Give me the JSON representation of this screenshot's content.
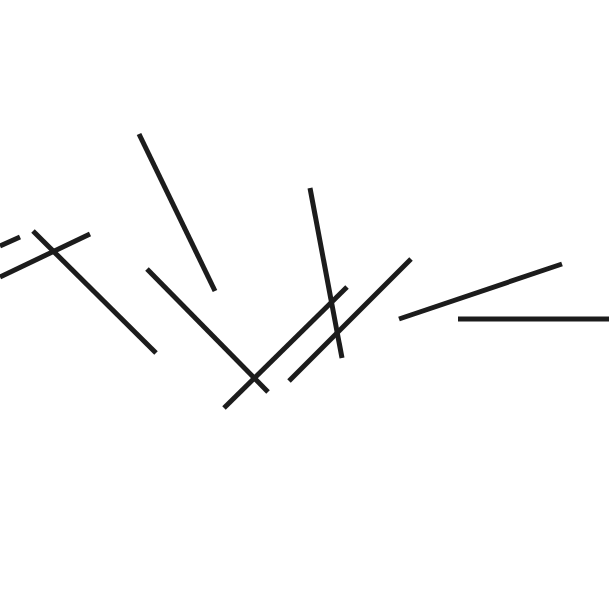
{
  "canvas": {
    "width": 609,
    "height": 600,
    "background": "#ffffff"
  },
  "stroke": {
    "color": "#1c1c1c",
    "width": 5
  },
  "lines": [
    {
      "id": "line-1",
      "x1": 0,
      "y1": 246,
      "x2": 20,
      "y2": 237
    },
    {
      "id": "line-2",
      "x1": 0,
      "y1": 277,
      "x2": 90,
      "y2": 234
    },
    {
      "id": "line-3",
      "x1": 33,
      "y1": 231,
      "x2": 156,
      "y2": 353
    },
    {
      "id": "line-4",
      "x1": 139,
      "y1": 134,
      "x2": 215,
      "y2": 291
    },
    {
      "id": "line-5",
      "x1": 147,
      "y1": 269,
      "x2": 268,
      "y2": 392
    },
    {
      "id": "line-6",
      "x1": 224,
      "y1": 408,
      "x2": 347,
      "y2": 287
    },
    {
      "id": "line-7",
      "x1": 310,
      "y1": 188,
      "x2": 342,
      "y2": 358
    },
    {
      "id": "line-8",
      "x1": 289,
      "y1": 381,
      "x2": 411,
      "y2": 259
    },
    {
      "id": "line-9",
      "x1": 399,
      "y1": 319,
      "x2": 562,
      "y2": 264
    },
    {
      "id": "line-10",
      "x1": 458,
      "y1": 319,
      "x2": 609,
      "y2": 319
    }
  ]
}
